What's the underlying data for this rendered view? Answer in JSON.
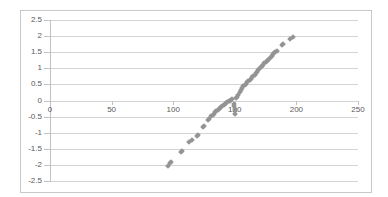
{
  "chart_data": {
    "type": "scatter",
    "title": "",
    "subtitle": "",
    "xlabel": "",
    "ylabel": "",
    "xlim": [
      0,
      250
    ],
    "ylim": [
      -2.5,
      2.5
    ],
    "grid": true,
    "legend": false,
    "legend_position": "none",
    "marker": {
      "shape": "square-rotated",
      "color": "#949494",
      "size_px": 4
    },
    "x_ticks": [
      0,
      50,
      100,
      150,
      200,
      250
    ],
    "x_tick_labels": [
      "0",
      "50",
      "100",
      "150",
      "200",
      "250"
    ],
    "y_ticks": [
      2.5,
      2,
      1.5,
      1,
      0.5,
      0,
      -0.5,
      -1,
      -1.5,
      -2,
      -2.5
    ],
    "y_tick_labels": [
      "2.5",
      "2",
      "1.5",
      "1",
      "0.5",
      "0",
      "-0.5",
      "-1",
      "-1.5",
      "-2",
      "-2.5"
    ],
    "series": [
      {
        "name": "Normal Score",
        "points": [
          [
            96,
            -2.02
          ],
          [
            97,
            -1.95
          ],
          [
            98,
            -1.92
          ],
          [
            106,
            -1.61
          ],
          [
            107,
            -1.58
          ],
          [
            113,
            -1.28
          ],
          [
            115,
            -1.24
          ],
          [
            119,
            -1.09
          ],
          [
            120,
            -1.06
          ],
          [
            124,
            -0.83
          ],
          [
            125,
            -0.8
          ],
          [
            128,
            -0.62
          ],
          [
            129,
            -0.57
          ],
          [
            131,
            -0.49
          ],
          [
            132,
            -0.44
          ],
          [
            133,
            -0.41
          ],
          [
            134,
            -0.37
          ],
          [
            135,
            -0.33
          ],
          [
            136,
            -0.29
          ],
          [
            137,
            -0.26
          ],
          [
            138,
            -0.22
          ],
          [
            139,
            -0.19
          ],
          [
            140,
            -0.16
          ],
          [
            141,
            -0.13
          ],
          [
            142,
            -0.1
          ],
          [
            143,
            -0.07
          ],
          [
            144,
            -0.05
          ],
          [
            145,
            -0.02
          ],
          [
            146,
            0.0
          ],
          [
            147,
            0.02
          ],
          [
            148,
            0.04
          ],
          [
            149,
            -0.1
          ],
          [
            149,
            -0.18
          ],
          [
            150,
            -0.26
          ],
          [
            150,
            -0.34
          ],
          [
            150,
            -0.41
          ],
          [
            151,
            0.07
          ],
          [
            152,
            0.12
          ],
          [
            153,
            0.18
          ],
          [
            154,
            0.26
          ],
          [
            155,
            0.33
          ],
          [
            156,
            0.4
          ],
          [
            157,
            0.44
          ],
          [
            158,
            0.48
          ],
          [
            159,
            0.52
          ],
          [
            160,
            0.56
          ],
          [
            161,
            0.6
          ],
          [
            162,
            0.64
          ],
          [
            163,
            0.68
          ],
          [
            164,
            0.72
          ],
          [
            165,
            0.76
          ],
          [
            166,
            0.8
          ],
          [
            167,
            0.85
          ],
          [
            168,
            0.9
          ],
          [
            169,
            0.94
          ],
          [
            170,
            0.98
          ],
          [
            171,
            1.03
          ],
          [
            172,
            1.07
          ],
          [
            173,
            1.11
          ],
          [
            174,
            1.15
          ],
          [
            175,
            1.19
          ],
          [
            176,
            1.23
          ],
          [
            177,
            1.26
          ],
          [
            178,
            1.3
          ],
          [
            179,
            1.34
          ],
          [
            180,
            1.38
          ],
          [
            181,
            1.43
          ],
          [
            182,
            1.47
          ],
          [
            183,
            1.51
          ],
          [
            184,
            1.55
          ],
          [
            188,
            1.72
          ],
          [
            189,
            1.75
          ],
          [
            195,
            1.92
          ],
          [
            197,
            1.96
          ]
        ]
      }
    ]
  },
  "colors": {
    "marker": "#949494",
    "gridline": "#d4d4d4",
    "axis": "#c2c2c2",
    "frame": "#c9c9c9",
    "tick_text": "#59595b",
    "background": "#ffffff"
  }
}
